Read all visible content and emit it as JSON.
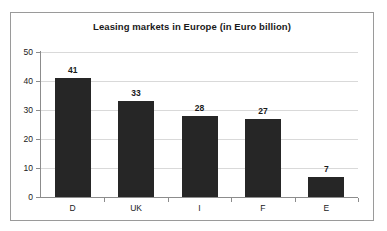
{
  "chart_data": {
    "type": "bar",
    "title": "Leasing markets in Europe (in Euro billion)",
    "xlabel": "",
    "ylabel": "",
    "categories": [
      "D",
      "UK",
      "I",
      "F",
      "E"
    ],
    "values": [
      41,
      33,
      28,
      27,
      7
    ],
    "data_labels": [
      "41",
      "33",
      "28",
      "27",
      "7"
    ],
    "ylim": [
      0,
      50
    ],
    "yticks": [
      0,
      10,
      20,
      30,
      40,
      50
    ],
    "ytick_labels": [
      "0",
      "10",
      "20",
      "30",
      "40",
      "50"
    ],
    "grid": "horizontal",
    "legend": "none",
    "series": [
      {
        "name": "Leasing market volume",
        "values": [
          41,
          33,
          28,
          27,
          7
        ]
      }
    ],
    "colors": {
      "bar": "#262626",
      "gridline": "#d9d9d9",
      "axis": "#8c8c8c",
      "text": "#1a1a1a",
      "background": "#ffffff",
      "frame": "#9a9a9a"
    }
  }
}
